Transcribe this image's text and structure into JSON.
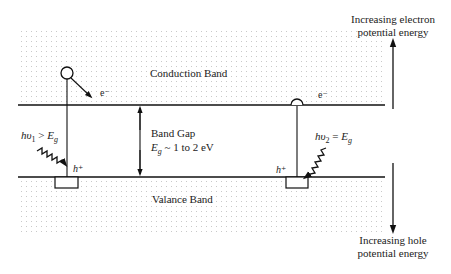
{
  "diagram": {
    "conduction_band_label": "Conduction Band",
    "valence_band_label": "Valance Band",
    "band_gap_label": "Band Gap",
    "band_gap_value": "E_g ~ 1 to 2 eV",
    "band_gap_value_parts": {
      "sym": "E",
      "sub": "g",
      "rest": " ~ 1 to 2 eV"
    },
    "electron_label_left": "e⁻",
    "electron_label_right": "e⁻",
    "hole_label_left": "h⁺",
    "hole_label_right": "h⁺",
    "photon_left": {
      "text": "hυ₁ > E_g",
      "h": "hυ",
      "sub": "1",
      "rel": " > ",
      "E": "E",
      "Esub": "g"
    },
    "photon_right": {
      "text": "hυ₂ = E_g",
      "h": "hυ",
      "sub": "2",
      "rel": " = ",
      "E": "E",
      "Esub": "g"
    },
    "up_arrow_label_line1": "Increasing electron",
    "up_arrow_label_line2": "potential energy",
    "down_arrow_label_line1": "Increasing hole",
    "down_arrow_label_line2": "potential energy",
    "colors": {
      "line": "#111111",
      "dots": "#9a9a9a",
      "background": "#ffffff"
    }
  }
}
